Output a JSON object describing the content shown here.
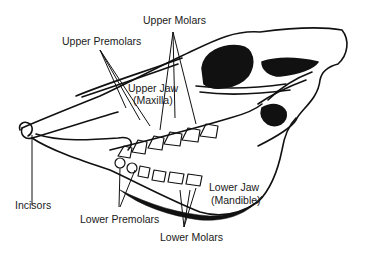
{
  "diagram": {
    "labels": {
      "upper_molars": "Upper Molars",
      "upper_premolars": "Upper Premolars",
      "upper_jaw": "Upper Jaw",
      "upper_jaw_latin": "(Maxilla)",
      "incisors": "Incisors",
      "lower_premolars": "Lower Premolars",
      "lower_jaw": "Lower Jaw",
      "lower_jaw_latin": "(Mandible)",
      "lower_molars": "Lower Molars"
    },
    "colors": {
      "ink": "#111111",
      "background": "#ffffff"
    }
  }
}
